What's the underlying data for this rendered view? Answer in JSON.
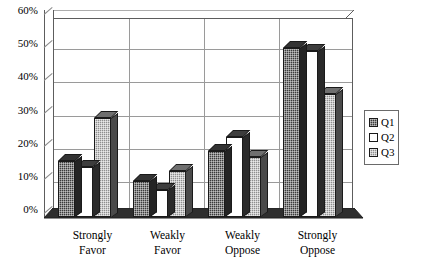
{
  "chart_data": {
    "type": "bar",
    "title": "",
    "subtitle": "",
    "xlabel": "",
    "ylabel": "",
    "categories": [
      "Strongly Favor",
      "Weakly Favor",
      "Weakly Oppose",
      "Strongly Oppose"
    ],
    "category_lines": [
      [
        "Strongly",
        "Favor"
      ],
      [
        "Weakly",
        "Favor"
      ],
      [
        "Weakly",
        "Oppose"
      ],
      [
        "Strongly",
        "Oppose"
      ]
    ],
    "series": [
      {
        "name": "Q1",
        "values": [
          17,
          11,
          20,
          51
        ],
        "color": "#3b3b3b",
        "pattern": "dark-checker"
      },
      {
        "name": "Q2",
        "values": [
          15,
          8,
          24,
          50
        ],
        "color": "#ffffff",
        "pattern": "solid-white"
      },
      {
        "name": "Q3",
        "values": [
          30,
          14,
          18,
          37
        ],
        "color": "#8e8e8e",
        "pattern": "light-checker"
      }
    ],
    "ylim": [
      0,
      60
    ],
    "ytick_values": [
      0,
      10,
      20,
      30,
      40,
      50,
      60
    ],
    "ytick_labels": [
      "0%",
      "10%",
      "20%",
      "30%",
      "40%",
      "50%",
      "60%"
    ],
    "grid": true,
    "grid_axis": "both",
    "legend_position": "right",
    "style": "3d-column",
    "value_suffix": "%"
  },
  "legend": {
    "entries": [
      {
        "label": "Q1",
        "swatch": "q1"
      },
      {
        "label": "Q2",
        "swatch": "q2"
      },
      {
        "label": "Q3",
        "swatch": "q3"
      }
    ]
  }
}
